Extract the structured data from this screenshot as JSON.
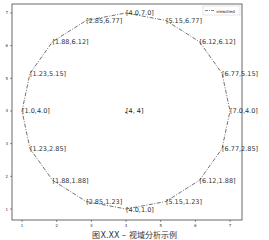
{
  "chart_data": {
    "type": "line",
    "title": "",
    "xlabel": "",
    "ylabel": "",
    "xlim": [
      0.7,
      7.3
    ],
    "ylim": [
      0.7,
      7.3
    ],
    "xticks": [
      1,
      2,
      3,
      4,
      5,
      6,
      7
    ],
    "yticks": [
      1,
      2,
      3,
      4,
      5,
      6,
      7
    ],
    "grid": false,
    "legend": {
      "position": "upper right",
      "entries": [
        "viewshed"
      ]
    },
    "center": {
      "x": 4,
      "y": 4,
      "label": "[4, 4]"
    },
    "series": [
      {
        "name": "viewshed",
        "style": "dashdot",
        "points": [
          {
            "x": 4.0,
            "y": 7.0,
            "label": "[4.0,7.0]"
          },
          {
            "x": 5.15,
            "y": 6.77,
            "label": "[5.15,6.77]"
          },
          {
            "x": 6.12,
            "y": 6.12,
            "label": "[6.12,6.12]"
          },
          {
            "x": 6.77,
            "y": 5.15,
            "label": "[6.77,5.15]"
          },
          {
            "x": 7.0,
            "y": 4.0,
            "label": "[7.0,4.0]"
          },
          {
            "x": 6.77,
            "y": 2.85,
            "label": "[6.77,2.85]"
          },
          {
            "x": 6.12,
            "y": 1.88,
            "label": "[6.12,1.88]"
          },
          {
            "x": 5.15,
            "y": 1.23,
            "label": "[5.15,1.23]"
          },
          {
            "x": 4.0,
            "y": 1.0,
            "label": "[4.0,1.0]"
          },
          {
            "x": 2.85,
            "y": 1.23,
            "label": "[2.85,1.23]"
          },
          {
            "x": 1.88,
            "y": 1.88,
            "label": "[1.88,1.88]"
          },
          {
            "x": 1.23,
            "y": 2.85,
            "label": "[1.23,2.85]"
          },
          {
            "x": 1.0,
            "y": 4.0,
            "label": "[1.0,4.0]"
          },
          {
            "x": 1.23,
            "y": 5.15,
            "label": "[1.23,5.15]"
          },
          {
            "x": 1.88,
            "y": 6.12,
            "label": "[1.88,6.12]"
          },
          {
            "x": 2.85,
            "y": 6.77,
            "label": "[2.85,6.77]"
          }
        ]
      }
    ]
  },
  "caption": "图X.XX – 视域分析示例"
}
